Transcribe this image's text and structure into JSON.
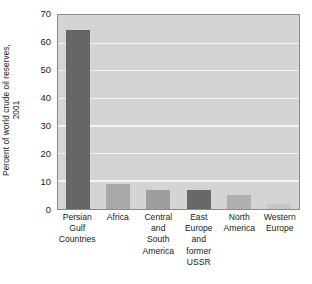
{
  "chart_data": {
    "type": "bar",
    "title": "",
    "subtitle": "",
    "xlabel": "",
    "ylabel": "Percent of world crude oil reserves, 2001",
    "ylabel_lines": [
      "Percent of world crude oil reserves,",
      "2001"
    ],
    "categories": [
      "Persian Gulf Countries",
      "Africa",
      "Central and South America",
      "East Europe and former USSR",
      "North America",
      "Western Europe"
    ],
    "category_lines": [
      [
        "Persian",
        "Gulf",
        "Countries"
      ],
      [
        "Africa"
      ],
      [
        "Central",
        "and",
        "South",
        "America"
      ],
      [
        "East",
        "Europe",
        "and",
        "former",
        "USSR"
      ],
      [
        "North",
        "America"
      ],
      [
        "Western",
        "Europe"
      ]
    ],
    "values": [
      65,
      9,
      7,
      7,
      5,
      2
    ],
    "bar_colors": [
      "#666666",
      "#a8a8a8",
      "#9e9e9e",
      "#686868",
      "#b0b0b0",
      "#c6c6c6"
    ],
    "ylim": [
      0,
      70
    ],
    "ytick_labels": [
      "0",
      "10",
      "20",
      "30",
      "40",
      "50",
      "60",
      "70"
    ],
    "ytick_values": [
      0,
      10,
      20,
      30,
      40,
      50,
      60,
      70
    ],
    "grid": true,
    "grid_color": "#f4f4f4",
    "plot_background": "#d4d4d4",
    "plot_border_color": "#8a8a8a",
    "legend": null,
    "legend_position": "none",
    "annotations": []
  }
}
